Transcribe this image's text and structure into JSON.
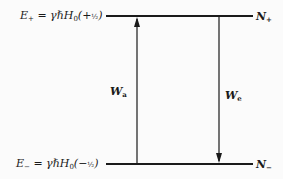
{
  "diagram": {
    "type": "two-level energy diagram",
    "upper_level": {
      "energy_symbol": "E",
      "energy_subscript": "+",
      "expression_prefix": " = γℏH",
      "expression_h_subscript": "0",
      "expression_paren_open": "(+",
      "expression_fraction": "½",
      "expression_paren_close": ")",
      "population_symbol": "N",
      "population_subscript": "+"
    },
    "lower_level": {
      "energy_symbol": "E",
      "energy_subscript": "−",
      "expression_prefix": " = γℏH",
      "expression_h_subscript": "0",
      "expression_paren_open": "(−",
      "expression_fraction": "½",
      "expression_paren_close": ")",
      "population_symbol": "N",
      "population_subscript": "−"
    },
    "transitions": [
      {
        "symbol": "W",
        "subscript": "a",
        "direction": "up",
        "meaning": "absorption"
      },
      {
        "symbol": "W",
        "subscript": "e",
        "direction": "down",
        "meaning": "emission"
      }
    ],
    "colors": {
      "line": "#1a1a1a",
      "background": "#fbfbfb"
    }
  }
}
